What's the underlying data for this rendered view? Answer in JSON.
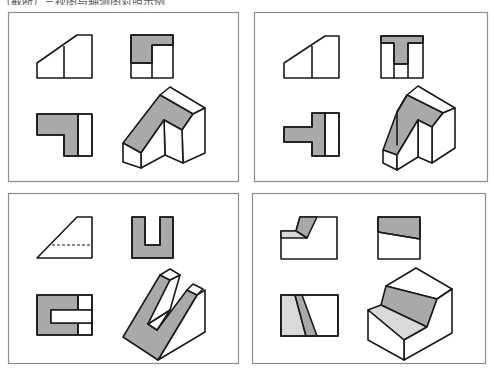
{
  "caption": {
    "text": "（截断）三视图与轴测图对照示例",
    "note": "top text line is cut off in the screenshot"
  },
  "colors": {
    "stroke": "#1a1a1a",
    "panel_border": "#8c8c8c",
    "dark_gray": "#a9a9a9",
    "light_gray": "#d9d9d9",
    "white": "#ffffff"
  },
  "panels": [
    {
      "id": "panel-1",
      "rect": [
        8,
        12,
        230,
        169
      ],
      "shapes": [
        {
          "name": "front-view-outline",
          "fill": "white",
          "points": "37,78 37,63 77,35 92,35 92,78"
        },
        {
          "name": "front-view-line",
          "line": "64,46 64,78"
        },
        {
          "name": "side-view-gray",
          "fill": "dark",
          "points": "131,35 173,35 173,45 152,45 152,63 131,63"
        },
        {
          "name": "side-view-outline",
          "fill": "none",
          "points": "131,35 173,35 173,78 131,78"
        },
        {
          "name": "side-view-line-1",
          "line": "152,45 152,78"
        },
        {
          "name": "side-view-line-2",
          "line": "152,45 173,45"
        },
        {
          "name": "side-view-line-3",
          "line": "131,63 152,63"
        },
        {
          "name": "top-view-gray",
          "fill": "dark",
          "points": "37,114 78,114 78,156 64,156 64,135 37,135"
        },
        {
          "name": "top-view-white",
          "fill": "white",
          "points": "78,114 92,114 92,156 78,156"
        },
        {
          "name": "top-view-outline",
          "fill": "none",
          "points": "37,114 92,114 92,156 64,156 64,135 37,135"
        },
        {
          "name": "top-view-line",
          "line": "78,114 78,156"
        },
        {
          "name": "iso-top-white",
          "fill": "white",
          "points": "160,95 170,87 205,108 193,114"
        },
        {
          "name": "iso-slope-gray",
          "fill": "dark",
          "points": "160,95 193,114 182,130 164,120 141,153 123,143"
        },
        {
          "name": "iso-right-face",
          "fill": "white",
          "points": "193,114 205,108 205,153 183,163 182,130"
        },
        {
          "name": "iso-notch-face",
          "fill": "white",
          "points": "164,120 182,130 183,163 165,155"
        },
        {
          "name": "iso-left-notch-face",
          "fill": "white",
          "points": "141,153 164,120 165,155 141,168"
        },
        {
          "name": "iso-front-left",
          "fill": "white",
          "points": "123,143 141,153 141,168 123,162"
        }
      ]
    },
    {
      "id": "panel-2",
      "rect": [
        254,
        12,
        233,
        169
      ],
      "shapes": [
        {
          "name": "front-view-outline",
          "fill": "white",
          "points": "284,78 284,63 325,36 339,36 339,78"
        },
        {
          "name": "front-view-line",
          "line": "312,46 312,78"
        },
        {
          "name": "side-view-gray",
          "fill": "dark",
          "points": "381,36 423,36 423,43 408,43 408,64 394,64 394,43 381,43"
        },
        {
          "name": "side-view-outline",
          "fill": "none",
          "points": "381,36 423,36 423,78 381,78"
        },
        {
          "name": "side-view-line-1",
          "line": "381,43 394,43"
        },
        {
          "name": "side-view-line-2",
          "line": "408,43 423,43"
        },
        {
          "name": "side-view-line-3",
          "line": "394,43 394,78"
        },
        {
          "name": "side-view-line-4",
          "line": "408,43 408,78"
        },
        {
          "name": "side-view-line-5",
          "line": "394,64 408,64"
        },
        {
          "name": "top-view-gray",
          "fill": "dark",
          "points": "284,127 312,127 312,113 325,113 325,156 312,156 312,142 284,142"
        },
        {
          "name": "top-view-white",
          "fill": "white",
          "points": "325,113 339,113 339,156 325,156"
        },
        {
          "name": "top-view-outline",
          "fill": "none",
          "points": "284,127 312,127 312,113 339,113 339,156 312,156 312,142 284,142"
        },
        {
          "name": "top-view-line",
          "line": "325,113 325,156"
        },
        {
          "name": "iso-top-white",
          "fill": "white",
          "points": "407,95 418,86 455,108 443,113"
        },
        {
          "name": "iso-t-gray",
          "fill": "dark",
          "points": "407,95 443,113 432,127 418,120 397,155 383,150 397,112"
        },
        {
          "name": "iso-right-face",
          "fill": "white",
          "points": "443,113 455,108 455,148 432,163 432,127"
        },
        {
          "name": "iso-inner-face",
          "fill": "white",
          "points": "418,120 432,127 432,163 418,157"
        },
        {
          "name": "iso-left-wing",
          "fill": "white",
          "points": "397,112 407,95 397,112 397,145"
        },
        {
          "name": "iso-stem-front",
          "fill": "white",
          "points": "383,150 397,155 397,170 383,163"
        },
        {
          "name": "iso-stem-side",
          "fill": "white",
          "points": "397,155 418,120 418,157 397,170"
        }
      ]
    },
    {
      "id": "panel-3",
      "rect": [
        8,
        193,
        230,
        170
      ],
      "shapes": [
        {
          "name": "front-view-outline",
          "fill": "white",
          "points": "37,258 77,217 92,217 92,258"
        },
        {
          "name": "front-view-hidden-line",
          "dashed": "52,245 92,245"
        },
        {
          "name": "side-view-gray",
          "fill": "dark",
          "points": "132,217 145,217 145,245 160,245 160,217 173,217 173,258 132,258"
        },
        {
          "name": "side-view-outline",
          "fill": "none",
          "points": "132,217 145,217 145,245 160,245 160,217 173,217 173,258 132,258"
        },
        {
          "name": "top-view-gray",
          "fill": "dark",
          "points": "37,295 78,295 78,310 51,310 51,323 78,323 78,335 37,335"
        },
        {
          "name": "top-view-white-upper",
          "fill": "white",
          "points": "78,295 92,295 92,310 78,310"
        },
        {
          "name": "top-view-white-lower",
          "fill": "white",
          "points": "78,323 92,323 92,335 78,335"
        },
        {
          "name": "top-view-slot",
          "fill": "white",
          "points": "51,310 92,310 92,323 51,323"
        },
        {
          "name": "top-view-outline",
          "fill": "none",
          "points": "37,295 92,295 92,335 37,335"
        },
        {
          "name": "top-view-line-1",
          "line": "78,295 78,310"
        },
        {
          "name": "top-view-line-2",
          "line": "78,323 78,335"
        },
        {
          "name": "iso-right-side",
          "fill": "white",
          "points": "197,295 205,290 205,332 158,360"
        },
        {
          "name": "iso-slope-gray",
          "fill": "dark",
          "points": "160,275 170,280 148,324 157,330 187,290 197,295 158,360 123,337"
        },
        {
          "name": "iso-slot-floor",
          "fill": "white",
          "points": "148,324 170,310 157,330"
        },
        {
          "name": "iso-slot-wall",
          "fill": "white",
          "points": "170,280 180,275 170,310 148,324"
        },
        {
          "name": "iso-left-cap",
          "fill": "white",
          "points": "160,275 170,269 180,275 170,280"
        },
        {
          "name": "iso-right-cap",
          "fill": "white",
          "points": "187,290 193,284 203,289 197,295"
        }
      ]
    },
    {
      "id": "panel-4",
      "rect": [
        252,
        193,
        233,
        170
      ],
      "shapes": [
        {
          "name": "front-view-outline",
          "fill": "white",
          "points": "281,231 296,231 300,217 337,217 337,259 281,259"
        },
        {
          "name": "front-view-dark",
          "fill": "dark",
          "points": "300,217 317,217 307,238 296,231"
        },
        {
          "name": "front-view-light",
          "fill": "light",
          "points": "281,231 296,231 307,238 281,238"
        },
        {
          "name": "side-view-gray",
          "fill": "dark",
          "points": "378,217 420,217 420,239 378,232"
        },
        {
          "name": "side-view-outline",
          "fill": "none",
          "points": "378,217 420,217 420,259 378,259"
        },
        {
          "name": "side-view-line",
          "line": "378,232 420,239"
        },
        {
          "name": "top-view-white",
          "fill": "white",
          "points": "281,295 338,295 338,336 281,336"
        },
        {
          "name": "top-view-light",
          "fill": "light",
          "points": "281,295 295,295 306,336 281,336"
        },
        {
          "name": "top-view-dark",
          "fill": "dark",
          "points": "295,295 302,295 317,336 306,336"
        },
        {
          "name": "top-view-outline",
          "fill": "none",
          "points": "281,295 338,295 338,336 281,336"
        },
        {
          "name": "iso-top-white",
          "fill": "white",
          "points": "386,286 416,268 452,289 437,299"
        },
        {
          "name": "iso-upper-step-dark",
          "fill": "dark",
          "points": "386,286 437,299 427,327 381,305"
        },
        {
          "name": "iso-lower-step-light",
          "fill": "light",
          "points": "368,310 381,305 427,327 404,340"
        },
        {
          "name": "iso-right-face",
          "fill": "white",
          "points": "437,299 452,289 452,333 404,360 404,340 427,327"
        },
        {
          "name": "iso-front-face",
          "fill": "white",
          "points": "368,310 404,340 404,360 368,340"
        }
      ]
    }
  ]
}
